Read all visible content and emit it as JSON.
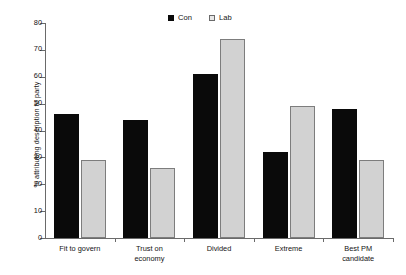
{
  "chart_data": {
    "type": "bar",
    "title": "",
    "subtitle": "",
    "xlabel": "",
    "ylabel": "% attributing description to party",
    "ylim": [
      0,
      80
    ],
    "ytick_step": 10,
    "yticks": [
      0,
      10,
      20,
      30,
      40,
      50,
      60,
      70,
      80
    ],
    "ytick_labels": [
      "0",
      "10",
      "20",
      "30",
      "40",
      "50",
      "60",
      "70",
      "80"
    ],
    "grid": false,
    "legend_position": "top-center",
    "categories": [
      "Fit to govern",
      "Trust on economy",
      "Divided",
      "Extreme",
      "Best PM candidate"
    ],
    "category_lines": [
      [
        "Fit to govern"
      ],
      [
        "Trust on",
        "economy"
      ],
      [
        "Divided"
      ],
      [
        "Extreme"
      ],
      [
        "Best PM",
        "candidate"
      ]
    ],
    "series": [
      {
        "name": "Con",
        "color": "#0a0a0a",
        "values": [
          46,
          44,
          61,
          32,
          48
        ]
      },
      {
        "name": "Lab",
        "color": "#d2d2d2",
        "values": [
          29,
          26,
          74,
          49,
          29
        ]
      }
    ]
  },
  "legend": {
    "entries": [
      {
        "label": "Con",
        "swatch": "filled-black-square"
      },
      {
        "label": "Lab",
        "swatch": "outlined-light-square"
      }
    ]
  }
}
